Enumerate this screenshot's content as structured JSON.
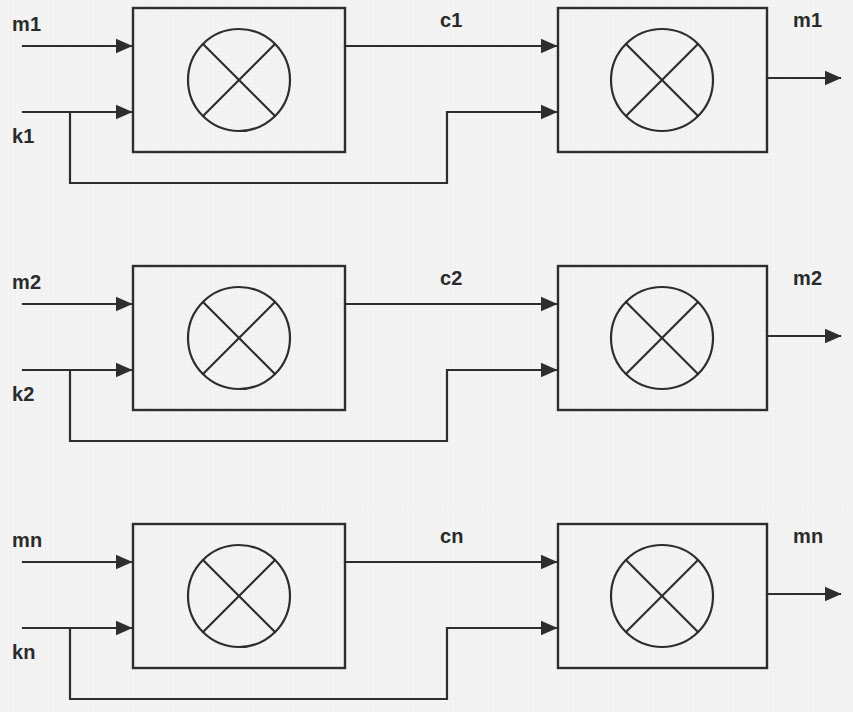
{
  "diagram": {
    "canvas": {
      "width": 853,
      "height": 712
    },
    "background_color": "#f4f4f4",
    "line_color": "#2e2e2e",
    "label_color": "#2b2b2b",
    "block_symbol": "circle-with-x",
    "block_symbol_meaning": "modulo-2 addition / XOR combiner",
    "rows": [
      {
        "index": 1,
        "plaintext_in_label": "m1",
        "key_in_label": "k1",
        "ciphertext_label": "c1",
        "plaintext_out_label": "m1",
        "encrypt_block_name": "encryptor-1",
        "decrypt_block_name": "decryptor-1",
        "geometry": {
          "box1_x": 133,
          "box1_y": 8,
          "box_w": 212,
          "box_h": 144,
          "box2_x": 558,
          "in_top_y": 46,
          "in_bot_y": 112,
          "out_y": 46,
          "out2_y": 78,
          "feedback_y": 183,
          "feedback_tee_x": 70,
          "feedback_riser_x": 447,
          "input_start_x": 23,
          "output_end_x": 840
        }
      },
      {
        "index": 2,
        "plaintext_in_label": "m2",
        "key_in_label": "k2",
        "ciphertext_label": "c2",
        "plaintext_out_label": "m2",
        "encrypt_block_name": "encryptor-2",
        "decrypt_block_name": "decryptor-2",
        "geometry": {
          "box1_x": 133,
          "box1_y": 266,
          "box_w": 212,
          "box_h": 144,
          "box2_x": 558,
          "in_top_y": 304,
          "in_bot_y": 370,
          "out_y": 304,
          "out2_y": 336,
          "feedback_y": 441,
          "feedback_tee_x": 70,
          "feedback_riser_x": 447,
          "input_start_x": 23,
          "output_end_x": 840
        }
      },
      {
        "index": 3,
        "plaintext_in_label": "mn",
        "key_in_label": "kn",
        "ciphertext_label": "cn",
        "plaintext_out_label": "mn",
        "encrypt_block_name": "encryptor-n",
        "decrypt_block_name": "decryptor-n",
        "geometry": {
          "box1_x": 133,
          "box1_y": 524,
          "box_w": 212,
          "box_h": 144,
          "box2_x": 558,
          "in_top_y": 562,
          "in_bot_y": 628,
          "out_y": 562,
          "out2_y": 594,
          "feedback_y": 699,
          "feedback_tee_x": 70,
          "feedback_riser_x": 447,
          "input_start_x": 23,
          "output_end_x": 840
        }
      }
    ],
    "label_positions": {
      "plaintext_in": {
        "x": 12,
        "y_offset": -32
      },
      "key_in": {
        "x": 12,
        "y_offset": 14
      },
      "ciphertext": {
        "x": 440,
        "y_offset": -36
      },
      "plaintext_out": {
        "x": 793,
        "y_offset": -36
      }
    }
  }
}
